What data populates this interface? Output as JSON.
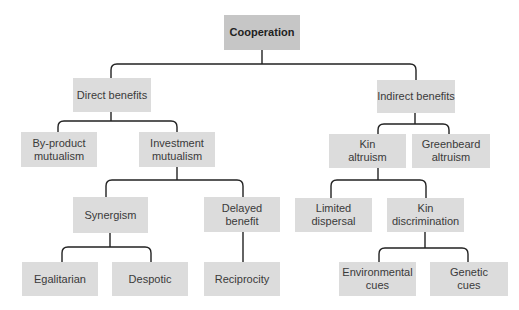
{
  "diagram": {
    "title": "Cooperation",
    "colors": {
      "root_fill": "#c6c6c6",
      "node_fill": "#dcdcdc",
      "line": "#222222",
      "text": "#3a3a3a"
    },
    "nodes": {
      "cooperation": "Cooperation",
      "direct_benefits": "Direct benefits",
      "indirect_benefits": "Indirect benefits",
      "by_product_mutualism": "By-product\nmutualism",
      "investment_mutualism": "Investment\nmutualism",
      "synergism": "Synergism",
      "delayed_benefit": "Delayed\nbenefit",
      "egalitarian": "Egalitarian",
      "despotic": "Despotic",
      "reciprocity": "Reciprocity",
      "kin_altruism": "Kin\naltruism",
      "greenbeard_altruism": "Greenbeard\naltruism",
      "limited_dispersal": "Limited\ndispersal",
      "kin_discrimination": "Kin\ndiscrimination",
      "environmental_cues": "Environmental\ncues",
      "genetic_cues": "Genetic\ncues"
    },
    "edges": [
      [
        "cooperation",
        "direct_benefits"
      ],
      [
        "cooperation",
        "indirect_benefits"
      ],
      [
        "direct_benefits",
        "by_product_mutualism"
      ],
      [
        "direct_benefits",
        "investment_mutualism"
      ],
      [
        "investment_mutualism",
        "synergism"
      ],
      [
        "investment_mutualism",
        "delayed_benefit"
      ],
      [
        "synergism",
        "egalitarian"
      ],
      [
        "synergism",
        "despotic"
      ],
      [
        "delayed_benefit",
        "reciprocity"
      ],
      [
        "indirect_benefits",
        "kin_altruism"
      ],
      [
        "indirect_benefits",
        "greenbeard_altruism"
      ],
      [
        "kin_altruism",
        "limited_dispersal"
      ],
      [
        "kin_altruism",
        "kin_discrimination"
      ],
      [
        "kin_discrimination",
        "environmental_cues"
      ],
      [
        "kin_discrimination",
        "genetic_cues"
      ]
    ]
  }
}
